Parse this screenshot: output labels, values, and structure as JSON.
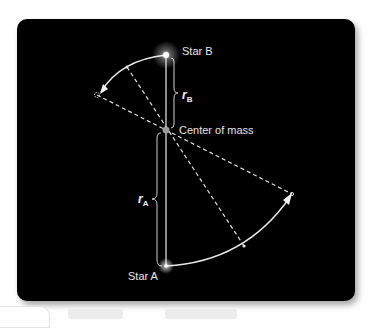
{
  "diagram": {
    "labels": {
      "star_b": "Star B",
      "star_a": "Star A",
      "center_of_mass": "Center of mass",
      "r_b": {
        "symbol": "r",
        "subscript": "B"
      },
      "r_a": {
        "symbol": "r",
        "subscript": "A"
      }
    },
    "points": {
      "star_b": [
        166,
        55
      ],
      "center_of_mass": [
        166,
        130
      ],
      "star_a": [
        166,
        266
      ],
      "star_b_arc_end": [
        97,
        95
      ],
      "star_b_arc_mid": [
        127,
        67
      ],
      "star_a_arc_end": [
        292,
        194
      ],
      "star_a_arc_mid": [
        244,
        246
      ]
    },
    "colors": {
      "background": "#000000",
      "line": "#e0e0e0",
      "label": "#e6e6e6",
      "center_marker": "#9a9a9a"
    }
  }
}
